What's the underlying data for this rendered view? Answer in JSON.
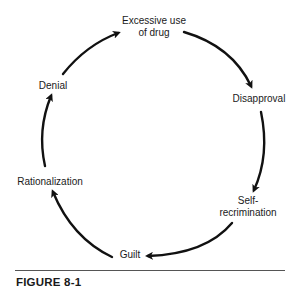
{
  "diagram": {
    "type": "cycle",
    "nodes": [
      {
        "id": "excessive",
        "label_line1": "Excessive use",
        "label_line2": "of drug"
      },
      {
        "id": "disapproval",
        "label": "Disapproval"
      },
      {
        "id": "self",
        "label_line1": "Self-",
        "label_line2": "recrimination"
      },
      {
        "id": "guilt",
        "label": "Guilt"
      },
      {
        "id": "rationalization",
        "label": "Rationalization"
      },
      {
        "id": "denial",
        "label": "Denial"
      }
    ],
    "edges": [
      {
        "from": "excessive",
        "to": "disapproval"
      },
      {
        "from": "disapproval",
        "to": "self"
      },
      {
        "from": "self",
        "to": "guilt"
      },
      {
        "from": "guilt",
        "to": "rationalization"
      },
      {
        "from": "rationalization",
        "to": "denial"
      },
      {
        "from": "denial",
        "to": "excessive"
      }
    ],
    "colors": {
      "stroke": "#111111",
      "text": "#1a1a1a",
      "rule": "#555555"
    }
  },
  "caption": "FIGURE 8-1"
}
